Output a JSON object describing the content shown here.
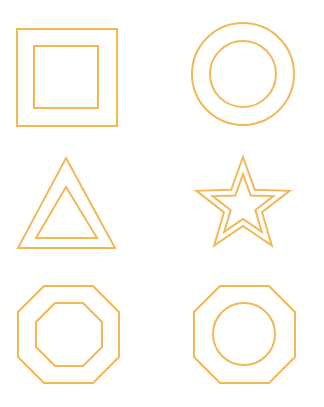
{
  "canvas": {
    "width": 324,
    "height": 407,
    "background_color": "#ffffff",
    "stroke_color": "#f2b857",
    "stroke_width": 2,
    "fill": "none"
  },
  "figure": {
    "grid": {
      "columns": 2,
      "rows": 3,
      "tile_count": 6
    }
  },
  "tiles": [
    {
      "id": "tile-square-in-square",
      "row": 1,
      "column": 1,
      "name": "square-in-square",
      "outer_shape": "square",
      "inner_shape": "square",
      "outer": {
        "x": 17,
        "y": 29,
        "width": 100,
        "height": 97
      },
      "inner": {
        "x": 34,
        "y": 46,
        "width": 64,
        "height": 62
      }
    },
    {
      "id": "tile-circle-in-circle",
      "row": 1,
      "column": 2,
      "name": "circle-in-circle",
      "outer_shape": "circle",
      "inner_shape": "circle",
      "outer": {
        "cx": 243,
        "cy": 74,
        "r": 51
      },
      "inner": {
        "cx": 243,
        "cy": 74,
        "r": 33
      }
    },
    {
      "id": "tile-triangle-in-triangle",
      "row": 2,
      "column": 1,
      "name": "triangle-in-triangle",
      "outer_shape": "triangle",
      "inner_shape": "triangle",
      "outer": {
        "points": "66,158 115,248 18,248"
      },
      "inner": {
        "points": "66,187 97,238 36,238"
      }
    },
    {
      "id": "tile-star-in-star",
      "row": 2,
      "column": 2,
      "name": "star-in-star",
      "outer_shape": "star",
      "inner_shape": "star",
      "points_count": 5,
      "outer": {
        "cx": 243,
        "cy": 206,
        "outer_radius": 49,
        "inner_radius": 20
      },
      "inner": {
        "cx": 243,
        "cy": 206,
        "outer_radius": 32,
        "inner_radius": 13
      }
    },
    {
      "id": "tile-octagon-in-octagon",
      "row": 3,
      "column": 1,
      "name": "octagon-in-octagon",
      "outer_shape": "octagon",
      "inner_shape": "octagon",
      "outer": {
        "x": 18,
        "y": 286,
        "width": 101,
        "height": 97,
        "bevel": 26
      },
      "inner": {
        "x": 36,
        "y": 303,
        "width": 66,
        "height": 63,
        "bevel": 19
      }
    },
    {
      "id": "tile-circle-in-octagon",
      "row": 3,
      "column": 2,
      "name": "circle-in-octagon",
      "outer_shape": "octagon",
      "inner_shape": "circle",
      "outer": {
        "x": 194,
        "y": 286,
        "width": 101,
        "height": 97,
        "bevel": 26
      },
      "inner": {
        "cx": 244,
        "cy": 334,
        "r": 31
      }
    }
  ]
}
